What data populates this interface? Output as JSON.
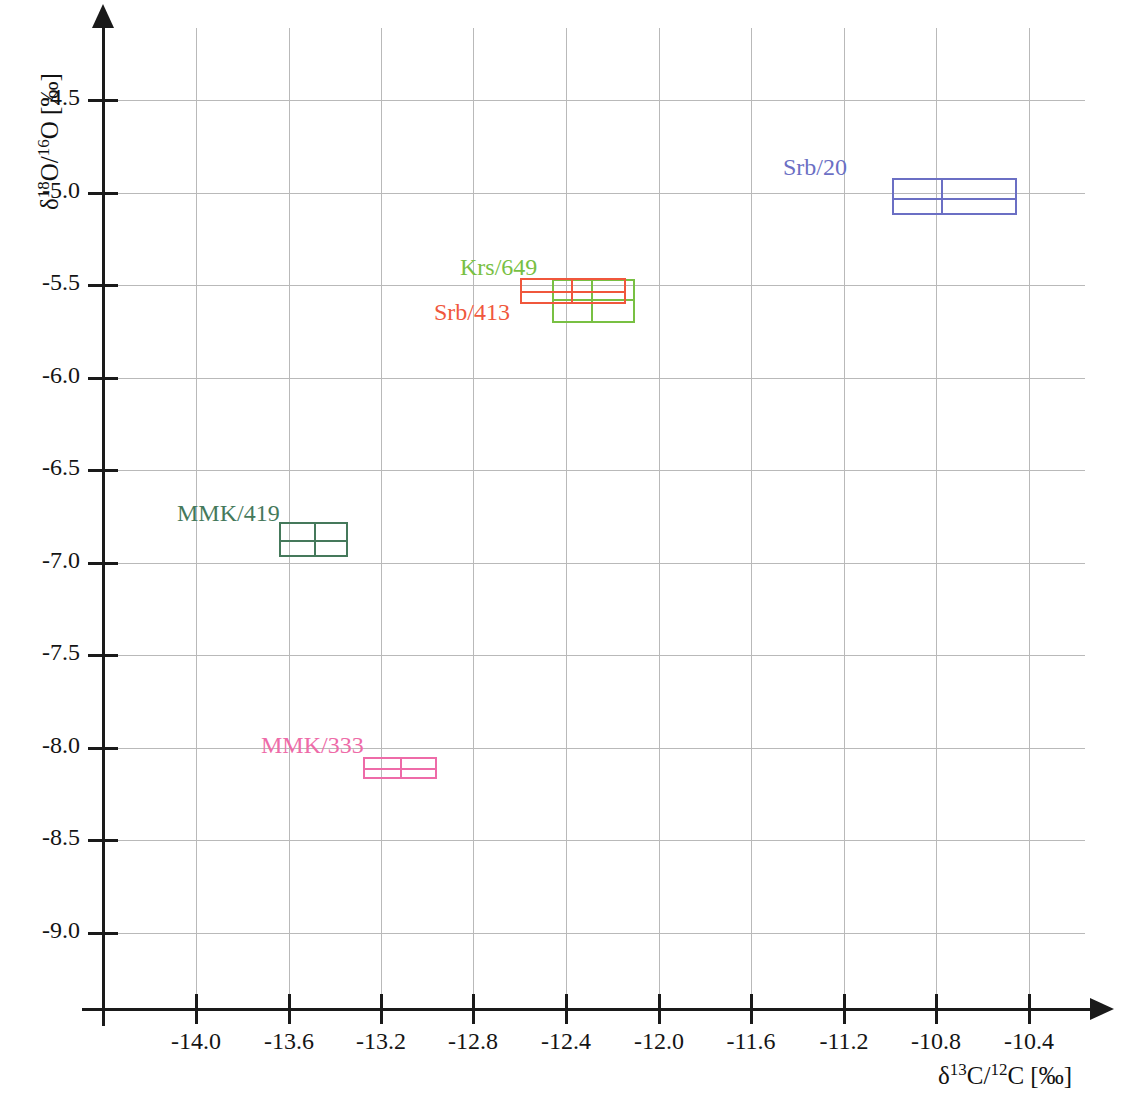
{
  "chart_data": {
    "type": "scatter",
    "title": "",
    "xlabel": "δ13C/12C [‰]",
    "ylabel": "δ18O/16O [‰]",
    "xlabel_parts": {
      "delta": "δ",
      "sup": "13",
      "mid": "C/",
      "sup2": "12",
      "tail": "C [‰]"
    },
    "ylabel_parts": {
      "delta": "δ",
      "sup": "18",
      "mid": "O/",
      "sup2": "16",
      "tail": "O [‰]"
    },
    "grid": true,
    "legend": "inline-labels",
    "xlim": [
      -14.38,
      -10.18
    ],
    "ylim": [
      -9.3,
      -4.27
    ],
    "xticks": [
      "-14.0",
      "-13.6",
      "-13.2",
      "-12.8",
      "-12.4",
      "-12.0",
      "-11.6",
      "-11.2",
      "-10.8",
      "-10.4"
    ],
    "xtick_values": [
      -14.0,
      -13.6,
      -13.2,
      -12.8,
      -12.4,
      -12.0,
      -11.6,
      -11.2,
      -10.8,
      -10.4
    ],
    "yticks": [
      "-4.5",
      "-5.0",
      "-5.5",
      "-6.0",
      "-6.5",
      "-7.0",
      "-7.5",
      "-8.0",
      "-8.5",
      "-9.0"
    ],
    "ytick_values": [
      -4.5,
      -5.0,
      -5.5,
      -6.0,
      -6.5,
      -7.0,
      -7.5,
      -8.0,
      -8.5,
      -9.0
    ],
    "series": [
      {
        "name": "Srb/20",
        "color": "#6b6fc4",
        "x_min": -10.99,
        "x_max": -10.45,
        "x_mean": -10.78,
        "y_min": -5.12,
        "y_max": -4.92,
        "y_mean": -5.03,
        "label_x": -11.46,
        "label_y": -4.88
      },
      {
        "name": "Krs/649",
        "color": "#78c043",
        "x_min": -12.46,
        "x_max": -12.1,
        "x_mean": -12.29,
        "y_min": -5.71,
        "y_max": -5.47,
        "y_mean": -5.58,
        "label_x": -12.86,
        "label_y": -5.42
      },
      {
        "name": "Srb/413",
        "color": "#f0573c",
        "x_min": -12.6,
        "x_max": -12.14,
        "x_mean": -12.38,
        "y_min": -5.6,
        "y_max": -5.46,
        "y_mean": -5.53,
        "label_x": -12.97,
        "label_y": -5.66
      },
      {
        "name": "MMK/419",
        "color": "#45795b",
        "x_min": -13.64,
        "x_max": -13.34,
        "x_mean": -13.49,
        "y_min": -6.97,
        "y_max": -6.78,
        "y_mean": -6.88,
        "label_x": -14.08,
        "label_y": -6.75
      },
      {
        "name": "MMK/333",
        "color": "#ee6ba8",
        "x_min": -13.28,
        "x_max": -12.96,
        "x_mean": -13.12,
        "y_min": -8.17,
        "y_max": -8.05,
        "y_mean": -8.11,
        "label_x": -13.72,
        "label_y": -8.0
      }
    ]
  },
  "axes": {
    "y_title_delta": "δ",
    "y_title_sup1": "18",
    "y_title_mid": "O/",
    "y_title_sup2": "16",
    "y_title_tail": "O [‰]",
    "x_title_delta": "δ",
    "x_title_sup1": "13",
    "x_title_mid": "C/",
    "x_title_sup2": "12",
    "x_title_tail": "C [‰]"
  }
}
